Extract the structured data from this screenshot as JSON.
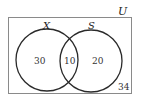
{
  "diagram": {
    "type": "venn",
    "universe_label": "U",
    "sets": [
      {
        "label": "X",
        "only_value": "30"
      },
      {
        "label": "S",
        "only_value": "20"
      }
    ],
    "intersection_value": "10",
    "outside_value": "34"
  },
  "colors": {
    "stroke": "#2a2a2a",
    "box": "#8a8a8a",
    "background": "#ffffff"
  }
}
